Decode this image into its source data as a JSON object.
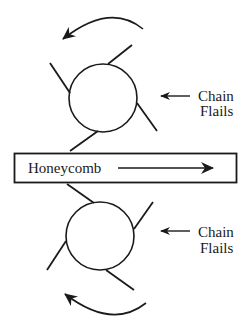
{
  "diagram": {
    "colors": {
      "stroke": "#1a1a1a",
      "background": "#ffffff"
    },
    "conveyor": {
      "label": "Honeycomb",
      "direction_icon": "arrow-right-icon"
    },
    "top_rotor": {
      "label_line1": "Chain",
      "label_line2": "Flails",
      "rotation": "counterclockwise",
      "rotation_icon": "curved-arrow-ccw-icon",
      "pointer_icon": "arrow-left-icon"
    },
    "bottom_rotor": {
      "label_line1": "Chain",
      "label_line2": "Flails",
      "rotation": "clockwise",
      "rotation_icon": "curved-arrow-cw-icon",
      "pointer_icon": "arrow-left-icon"
    }
  }
}
